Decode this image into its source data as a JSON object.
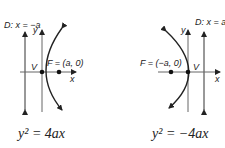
{
  "diagrams": [
    {
      "name": "right-opening-parabola",
      "directrix_label": "D: x = −a",
      "y_axis_label": "y",
      "x_axis_label": "x",
      "vertex_label": "V",
      "focus_label": "F = (a, 0)",
      "equation": "y² = 4ax"
    },
    {
      "name": "left-opening-parabola",
      "directrix_label": "D: x = a",
      "y_axis_label": "y",
      "x_axis_label": "x",
      "vertex_label": "V",
      "focus_label": "F = (−a, 0)",
      "equation": "y² = −4ax"
    }
  ],
  "colors": {
    "stroke": "#222222",
    "background": "#ffffff"
  }
}
